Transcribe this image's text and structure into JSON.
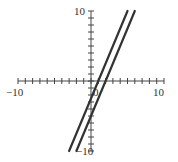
{
  "chart_data": {
    "type": "line",
    "title": "",
    "xlabel": "",
    "ylabel": "",
    "xlim": [
      -10,
      10
    ],
    "ylim": [
      -10,
      10
    ],
    "grid": false,
    "tick_step": 1,
    "tick_labels": {
      "x_min": "−10",
      "x_max": "10",
      "y_max": "10",
      "y_min": "−10",
      "origin": "0"
    },
    "series": [
      {
        "name": "line-1",
        "equation": "y = 2.5x - 2.5",
        "slope": 2.5,
        "intercept": -2.5,
        "x": [
          -3,
          5
        ],
        "y": [
          -10,
          10
        ],
        "color": "#333333"
      },
      {
        "name": "line-2",
        "equation": "y = 2.5x - 5",
        "slope": 2.5,
        "intercept": -5,
        "x": [
          -2,
          6
        ],
        "y": [
          -10,
          10
        ],
        "color": "#333333"
      }
    ]
  }
}
